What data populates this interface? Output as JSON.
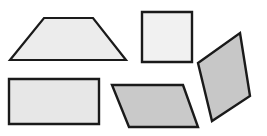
{
  "figure": {
    "background_color": "#ffffff",
    "width": 267,
    "height": 136,
    "shape_count": 5
  },
  "shapes": [
    {
      "id": "trapezoid",
      "label": "trapezoid",
      "points": "44,18 93,18 126,60 10,60",
      "fill": "#ececec",
      "stroke": "#1a1a1a",
      "stroke_width": 2.2,
      "position": "top-left"
    },
    {
      "id": "square",
      "label": "square",
      "points": "142,12 192,12 192,62 142,62",
      "fill": "#f1f1f1",
      "stroke": "#1a1a1a",
      "stroke_width": 2.4,
      "position": "top-center"
    },
    {
      "id": "tilted-parallelogram",
      "label": "tilted parallelogram",
      "points": "240,33 250,96 212,121 198,63",
      "fill": "#c7c7c7",
      "stroke": "#1a1a1a",
      "stroke_width": 2.4,
      "position": "right"
    },
    {
      "id": "rectangle",
      "label": "rectangle",
      "points": "9,79 99,79 99,124 9,124",
      "fill": "#e7e7e7",
      "stroke": "#1a1a1a",
      "stroke_width": 2.4,
      "position": "bottom-left"
    },
    {
      "id": "parallelogram",
      "label": "parallelogram",
      "points": "112,85 183,85 198,127 129,127",
      "fill": "#c9c9c9",
      "stroke": "#1a1a1a",
      "stroke_width": 2.4,
      "position": "bottom-center"
    }
  ]
}
